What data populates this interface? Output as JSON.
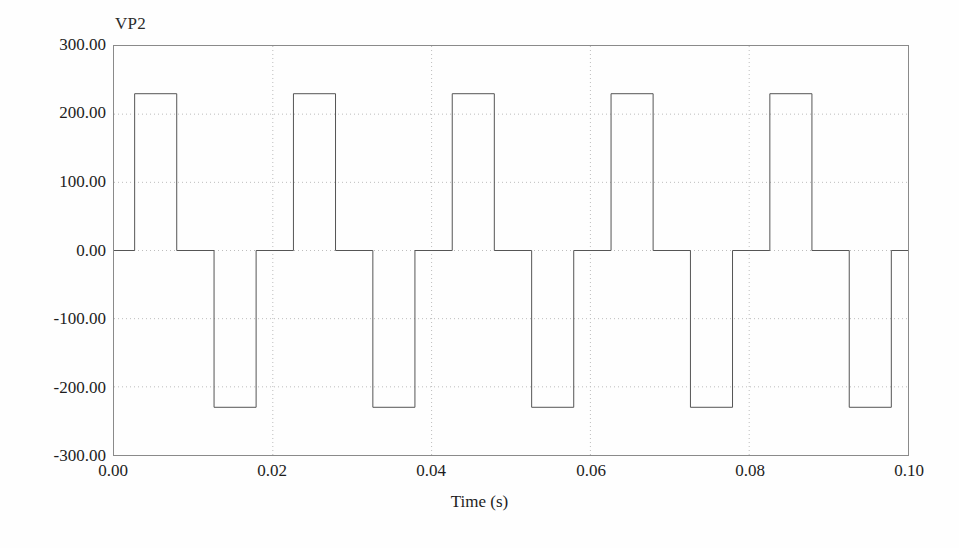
{
  "figure": {
    "series_label": "VP2",
    "background_color": "#fefefe",
    "axis_color": "#8a8a8a",
    "grid_color": "#bdbdbd",
    "curve_color": "#555555",
    "text_color": "#1d1d1d"
  },
  "axes": {
    "x_title": "Time (s)",
    "y_title": "",
    "x_ticks": [
      "0.00",
      "0.02",
      "0.04",
      "0.06",
      "0.08",
      "0.10"
    ],
    "y_ticks": [
      "300.00",
      "200.00",
      "100.00",
      "0.00",
      "-100.00",
      "-200.00",
      "-300.00"
    ]
  },
  "chart_data": {
    "type": "line",
    "title": "",
    "subtitle": "",
    "xlabel": "Time (s)",
    "ylabel": "VP2",
    "xlim": [
      0.0,
      0.1
    ],
    "ylim": [
      -300.0,
      300.0
    ],
    "xticks": [
      0.0,
      0.02,
      0.04,
      0.06,
      0.08,
      0.1
    ],
    "yticks": [
      300.0,
      200.0,
      100.0,
      0.0,
      -100.0,
      -200.0,
      -300.0
    ],
    "grid": true,
    "grid_style": "dotted",
    "legend": "none",
    "waveform_description": "Quasi-square (six-step / modified square) inverter output voltage waveform: each 0.02 s cycle consists of a zero interval, a positive 230 V pulse, a zero interval, and a negative 230 V pulse.",
    "amplitude_positive": 230.0,
    "amplitude_negative": -230.0,
    "period_s": 0.02,
    "frequency_hz": 50,
    "pulse_width_s": 0.0053,
    "series": [
      {
        "name": "VP2",
        "x": [
          0.0,
          0.0026,
          0.0026,
          0.0079,
          0.0079,
          0.0126,
          0.0126,
          0.0179,
          0.0179,
          0.0226,
          0.0226,
          0.0279,
          0.0279,
          0.0326,
          0.0326,
          0.0379,
          0.0379,
          0.0426,
          0.0426,
          0.0479,
          0.0479,
          0.0526,
          0.0526,
          0.0579,
          0.0579,
          0.0626,
          0.0626,
          0.0679,
          0.0679,
          0.0726,
          0.0726,
          0.0779,
          0.0779,
          0.0826,
          0.0826,
          0.0879,
          0.0879,
          0.0926,
          0.0926,
          0.0979,
          0.0979,
          0.1
        ],
        "y": [
          0,
          0,
          230,
          230,
          0,
          0,
          -230,
          -230,
          0,
          0,
          230,
          230,
          0,
          0,
          -230,
          -230,
          0,
          0,
          230,
          230,
          0,
          0,
          -230,
          -230,
          0,
          0,
          230,
          230,
          0,
          0,
          -230,
          -230,
          0,
          0,
          230,
          230,
          0,
          0,
          -230,
          -230,
          0,
          0
        ]
      }
    ]
  }
}
